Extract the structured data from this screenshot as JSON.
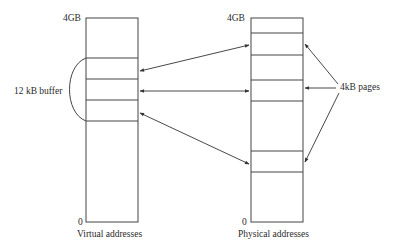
{
  "diagram": {
    "type": "memory-mapping",
    "virtual": {
      "top_label": "4GB",
      "bottom_label": "0",
      "caption": "Virtual addresses",
      "box": {
        "x": 86,
        "y": 18,
        "w": 52,
        "h": 204
      },
      "dividers_y": [
        58,
        79,
        100,
        121
      ]
    },
    "physical": {
      "top_label": "4GB",
      "bottom_label": "0",
      "caption": "Physical addresses",
      "box": {
        "x": 251,
        "y": 18,
        "w": 52,
        "h": 204
      },
      "dividers_y": [
        33,
        55,
        80,
        101,
        151,
        172
      ]
    },
    "buffer_label": "12 kB buffer",
    "pages_label": "4kB pages",
    "mappings": [
      {
        "from": "virtual-page-1",
        "to": "physical-page-2",
        "bidirectional": true
      },
      {
        "from": "virtual-page-2",
        "to": "physical-page-4",
        "bidirectional": true
      },
      {
        "from": "virtual-page-3",
        "to": "physical-page-6",
        "bidirectional": true
      }
    ],
    "stroke_color": "#333333"
  }
}
